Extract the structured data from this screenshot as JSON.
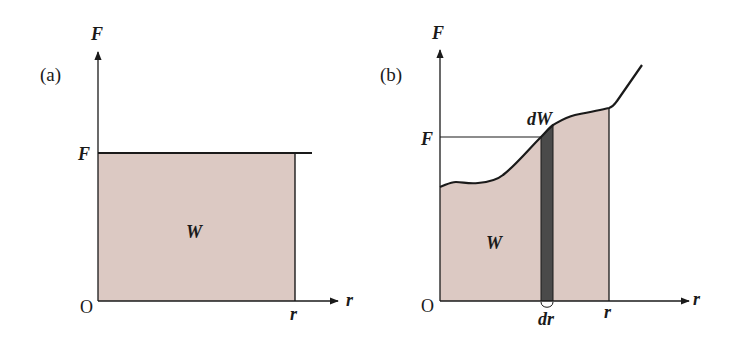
{
  "colors": {
    "area_fill": "#dcc9c3",
    "strip_fill": "#4a4a4a",
    "line": "#1a1a1a",
    "background": "#ffffff"
  },
  "panel_a": {
    "label": "(a)",
    "y_axis_label": "F",
    "x_axis_label": "r",
    "origin_label": "O",
    "force_tick_label": "F",
    "x_end_label": "r",
    "area_label": "W",
    "description": "Constant force F over displacement r; work W is the shaded rectangle"
  },
  "panel_b": {
    "label": "(b)",
    "y_axis_label": "F",
    "x_axis_label": "r",
    "origin_label": "O",
    "force_tick_label": "F",
    "x_end_label": "r",
    "area_label": "W",
    "strip_label": "dW",
    "strip_width_label": "dr",
    "description": "Variable force F(r); work W is area under curve, dW = F dr strip"
  }
}
